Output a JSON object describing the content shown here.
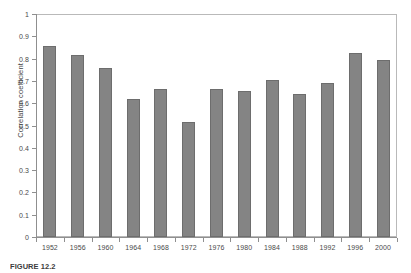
{
  "chart_data": {
    "type": "bar",
    "title": "",
    "subtitle": "",
    "xlabel": "",
    "ylabel": "Correlation coefficient",
    "categories": [
      "1952",
      "1956",
      "1960",
      "1964",
      "1968",
      "1972",
      "1976",
      "1980",
      "1984",
      "1988",
      "1992",
      "1996",
      "2000"
    ],
    "values": [
      0.855,
      0.818,
      0.757,
      0.618,
      0.665,
      0.515,
      0.662,
      0.655,
      0.702,
      0.643,
      0.69,
      0.825,
      0.795
    ],
    "series": [
      {
        "name": "Correlation coefficient",
        "values": [
          0.855,
          0.818,
          0.757,
          0.618,
          0.665,
          0.515,
          0.662,
          0.655,
          0.702,
          0.643,
          0.69,
          0.825,
          0.795
        ]
      }
    ],
    "ylim": [
      0,
      1
    ],
    "ytick_labels": [
      "0",
      "0.1",
      "0.2",
      "0.3",
      "0.4",
      "0.5",
      "0.6",
      "0.7",
      "0.8",
      "0.9",
      "1"
    ],
    "ytick_values": [
      0,
      0.1,
      0.2,
      0.3,
      0.4,
      0.5,
      0.6,
      0.7,
      0.8,
      0.9,
      1
    ],
    "grid": false,
    "legend": false,
    "legend_position": "none",
    "bar_color": "#848484",
    "bar_edge_color": "#6d6d6d",
    "axis_color": "#8f8f8f",
    "frame_color": "#b9b9b9",
    "background_color": "#ffffff",
    "annotations": []
  },
  "caption": {
    "label": "FIGURE 12.2",
    "text": ""
  }
}
